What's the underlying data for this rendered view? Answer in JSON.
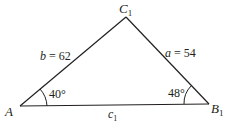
{
  "diagram": {
    "type": "triangle",
    "vertices": {
      "A": {
        "label": "A",
        "sub": ""
      },
      "B": {
        "label": "B",
        "sub": "1"
      },
      "C": {
        "label": "C",
        "sub": "1"
      }
    },
    "sides": {
      "b": {
        "var": "b",
        "eq": " = 62"
      },
      "a": {
        "var": "a",
        "eq": " = 54"
      },
      "c": {
        "var": "c",
        "sub": "1"
      }
    },
    "angles": {
      "A": "40°",
      "B": "48°"
    },
    "colors": {
      "stroke": "#231f20",
      "text": "#231f20"
    }
  }
}
